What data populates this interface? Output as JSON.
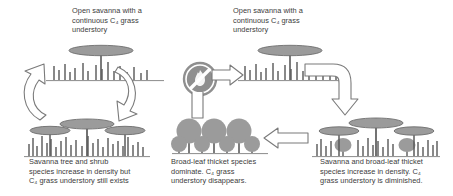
{
  "diagram": {
    "colors": {
      "text": "#3b3b3b",
      "canopy_fill": "#9b9b9b",
      "canopy_stroke": "#6e6e6e",
      "trunk": "#5a5a5a",
      "grass": "#4a4a4a",
      "ground_line": "#8c8c8c",
      "arrow_stroke": "#7a7a7a",
      "arrow_fill": "#ffffff",
      "nofire_fill": "#8f8f8f",
      "nofire_slash": "#ffffff",
      "background": "#ffffff"
    },
    "captions": {
      "top_left": "Open savanna with a\ncontinuous C₄ grass\nunderstory",
      "top_right": "Open savanna with a\ncontinuous C₄ grass\nunderstory",
      "bottom_left": "Savanna tree and shrub\nspecies increase in density but\nC₄ grass understory still exists",
      "bottom_middle": "Broad-leaf thicket species\ndominate. C₄ grass\nunderstory disappears.",
      "bottom_right": "Savanna and broad-leaf thicket\nspecies increase in density. C₄\ngrass understory is diminished."
    },
    "scenes": {
      "open_savanna_left": {
        "name": "open-savanna-left",
        "description": "Single flat-topped savanna tree with sparse C4 grass tufts"
      },
      "open_savanna_right": {
        "name": "open-savanna-right",
        "description": "Single flat-topped savanna tree with sparse C4 grass tufts"
      },
      "dense_savanna": {
        "name": "dense-savanna",
        "description": "Three flat-topped savanna trees with dense C4 grass tufts"
      },
      "mixed_thicket": {
        "name": "mixed-savanna-thicket",
        "description": "Flat-topped savanna trees mixed with round broad-leaf shrubs and reduced grass"
      },
      "broadleaf_thicket": {
        "name": "broadleaf-thicket",
        "description": "Dense round-canopy broad-leaf trees in two rows with no grass understory"
      }
    },
    "arrows": {
      "cycle_up_left": "curved arrow pointing up",
      "cycle_down_right": "curved arrow pointing down",
      "nofire_right": "block arrow pointing right",
      "elbow_down": "elbow block arrow turning right then down",
      "thicket_left": "block arrow pointing left"
    },
    "icons": {
      "no_fire": {
        "name": "no-fire-icon",
        "label": "fire suppression"
      }
    }
  }
}
